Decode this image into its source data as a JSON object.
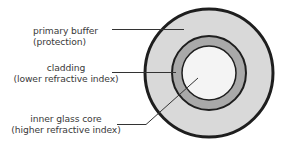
{
  "diagram": {
    "layers": [
      {
        "id": "primary-buffer",
        "label_line1": "primary buffer",
        "label_line2": "(protection)",
        "fill": "#d9d9d9",
        "stroke": "#1e1e1e",
        "radius": 65
      },
      {
        "id": "cladding",
        "label_line1": "cladding",
        "label_line2": "(lower refractive index)",
        "fill": "#a9a9a9",
        "stroke": "#1e1e1e",
        "radius": 37
      },
      {
        "id": "inner-glass-core",
        "label_line1": "inner glass core",
        "label_line2": "(higher refractive index)",
        "fill": "#f4f4f4",
        "stroke": "#1e1e1e",
        "radius": 28
      }
    ],
    "center": {
      "x": 209,
      "y": 73
    }
  }
}
